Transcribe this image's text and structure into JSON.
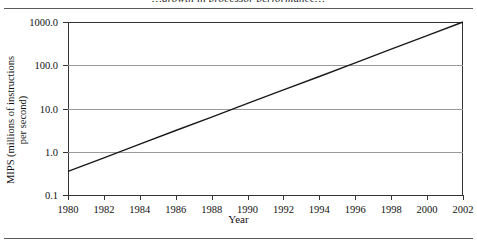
{
  "figure": {
    "clipped_caption": "…growth in processor performance…",
    "frame_rules": 2
  },
  "chart_data": {
    "type": "line",
    "title": "",
    "xlabel": "Year",
    "ylabel": "MIPS (millions of instructions per second)",
    "ylabel_line1": "MIPS (millions of instructions",
    "ylabel_line2": "per second)",
    "yscale": "log",
    "xscale": "linear",
    "xlim": [
      1980,
      2002
    ],
    "ylim": [
      0.1,
      1000.0
    ],
    "grid": true,
    "grid_axis": "y",
    "legend": null,
    "x_tick_labels": [
      "1980",
      "1982",
      "1984",
      "1986",
      "1988",
      "1990",
      "1992",
      "1994",
      "1996",
      "1998",
      "2000",
      "2002"
    ],
    "x_tick_values": [
      1980,
      1982,
      1984,
      1986,
      1988,
      1990,
      1992,
      1994,
      1996,
      1998,
      2000,
      2002
    ],
    "y_tick_labels": [
      "1000.0",
      "100.0",
      "10.0",
      "1.0",
      "0.1"
    ],
    "y_tick_values": [
      1000.0,
      100.0,
      10.0,
      1.0,
      0.1
    ],
    "series": [
      {
        "name": "Processor performance",
        "x": [
          1980,
          1982,
          1984,
          1986,
          1988,
          1990,
          1992,
          1994,
          1996,
          1998,
          2000,
          2002
        ],
        "y": [
          0.35,
          0.72,
          1.5,
          3.1,
          6.3,
          13.1,
          27,
          55,
          114,
          235,
          485,
          1000
        ],
        "color": "#1a1a1a"
      }
    ],
    "annotations": []
  }
}
